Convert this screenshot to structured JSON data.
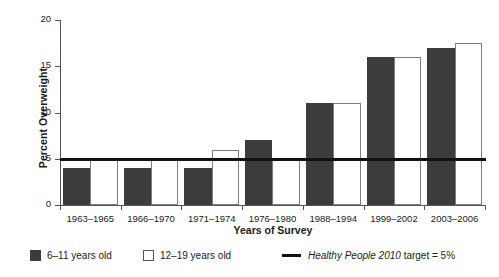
{
  "chart_data": {
    "type": "bar",
    "title": "",
    "subtitle": "",
    "xlabel": "Years of Survey",
    "ylabel": "Percent Overweight",
    "categories": [
      "1963–1965",
      "1966–1970",
      "1971–1974",
      "1976–1980",
      "1988–1994",
      "1999–2002",
      "2003–2006"
    ],
    "series": [
      {
        "name": "6–11 years old",
        "values": [
          4,
          4,
          4,
          7,
          11,
          16,
          17
        ]
      },
      {
        "name": "12–19 years old",
        "values": [
          5,
          5,
          6,
          5,
          11,
          16,
          17.5
        ]
      }
    ],
    "reference_line": {
      "label_italic": "Healthy People 2010",
      "label_rest": " target = 5%",
      "value": 5
    },
    "ylim": [
      0,
      20
    ],
    "yticks": [
      0,
      5,
      10,
      15,
      20
    ],
    "ytick_labels": [
      "0",
      "5",
      "10",
      "15",
      "20"
    ],
    "grid": false,
    "legend_position": "bottom"
  },
  "legend": {
    "series_one_label": "6–11 years old",
    "series_two_label": "12–19 years old",
    "reference_italic": "Healthy People 2010",
    "reference_rest": " target = 5%"
  },
  "colors": {
    "series_one": "#3c3c3c",
    "series_two": "#ffffff",
    "series_two_border": "#7d7d7d",
    "reference_line": "#111111",
    "axis": "#555555",
    "text": "#1a1a1a"
  }
}
